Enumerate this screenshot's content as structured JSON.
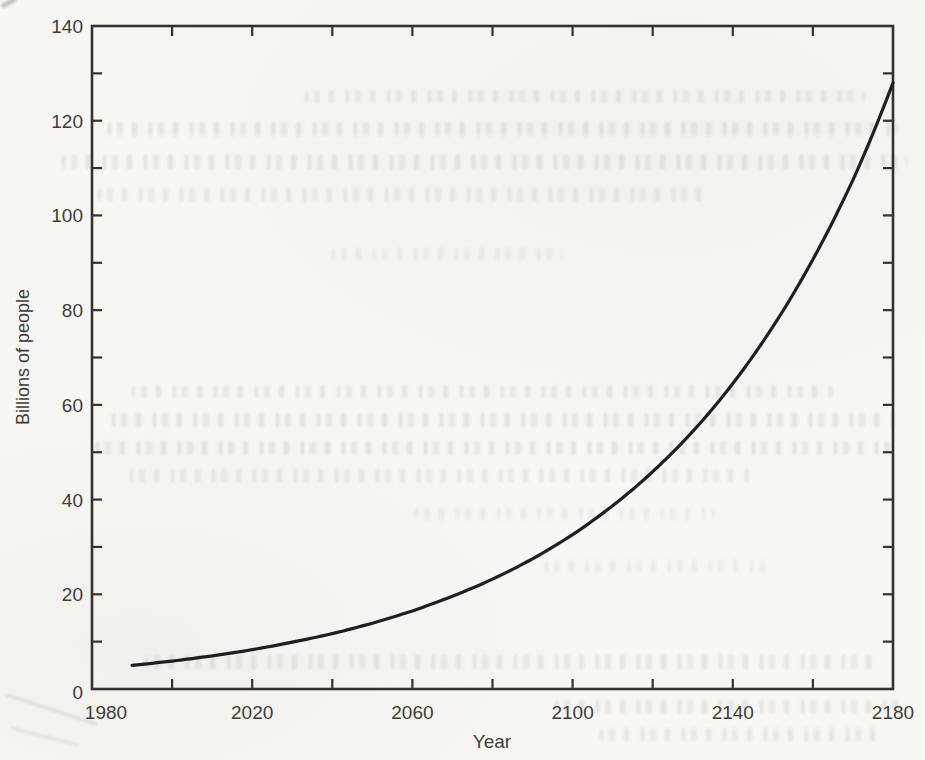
{
  "colors": {
    "paper": "#f8f7f4",
    "curve_ink": "#211f1d",
    "axis_ink": "#35322e",
    "label_ink": "#3f3d3a"
  },
  "chart_data": {
    "type": "line",
    "title": "",
    "xlabel": "Year",
    "ylabel": "Billions of people",
    "xlim": [
      1980,
      2180
    ],
    "ylim": [
      0,
      140
    ],
    "x_tick_labels": [
      "1980",
      "2020",
      "2060",
      "2100",
      "2140",
      "2180"
    ],
    "x_tick_values": [
      1980,
      2020,
      2060,
      2100,
      2140,
      2180
    ],
    "x_minor_tick_step": 20,
    "y_tick_labels": [
      "0",
      "20",
      "40",
      "60",
      "80",
      "100",
      "120",
      "140"
    ],
    "y_tick_values": [
      0,
      20,
      40,
      60,
      80,
      100,
      120,
      140
    ],
    "y_minor_tick_step": 10,
    "grid": false,
    "legend_position": "none",
    "tick_direction": "inward on all four box sides",
    "series": [
      {
        "name": "population-curve",
        "x": [
          1990,
          2000,
          2010,
          2020,
          2030,
          2040,
          2050,
          2060,
          2070,
          2080,
          2090,
          2100,
          2110,
          2120,
          2130,
          2140,
          2150,
          2160,
          2170,
          2180
        ],
        "y": [
          5.0,
          5.9,
          7.0,
          8.3,
          9.9,
          11.7,
          13.9,
          16.5,
          19.6,
          23.2,
          27.5,
          32.6,
          38.7,
          45.9,
          54.4,
          64.5,
          76.5,
          90.7,
          107.5,
          128.0
        ]
      }
    ]
  }
}
